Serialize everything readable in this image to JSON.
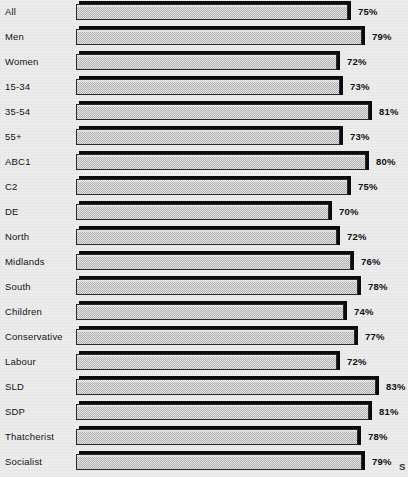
{
  "chart_data": {
    "type": "bar",
    "orientation": "horizontal",
    "title": "",
    "subtitle": "",
    "xlabel": "",
    "ylabel": "",
    "xlim": [
      0,
      100
    ],
    "grid": false,
    "legend": null,
    "value_suffix": "%",
    "categories": [
      "All",
      "Men",
      "Women",
      "15-34",
      "35-54",
      "55+",
      "ABC1",
      "C2",
      "DE",
      "North",
      "Midlands",
      "South",
      "Children",
      "Conservative",
      "Labour",
      "SLD",
      "SDP",
      "Thatcherist",
      "Socialist"
    ],
    "values": [
      75,
      79,
      72,
      73,
      81,
      73,
      80,
      75,
      70,
      72,
      76,
      78,
      74,
      77,
      72,
      83,
      81,
      78,
      79
    ],
    "value_labels": [
      "75%",
      "79%",
      "72%",
      "73%",
      "81%",
      "73%",
      "80%",
      "75%",
      "70%",
      "72%",
      "76%",
      "78%",
      "74%",
      "77%",
      "72%",
      "83%",
      "81%",
      "78%",
      "79%"
    ]
  },
  "style": {
    "background_color": "#ececec",
    "bar_face_color": "#c9c9c9",
    "bar_shadow_color": "#0b0b0b",
    "text_color": "#141414"
  },
  "artifacts": {
    "bottom_right_fragment": "S"
  }
}
